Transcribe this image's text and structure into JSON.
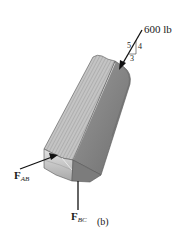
{
  "figure": {
    "caption": "(b)",
    "applied_load": {
      "label": "600 lb",
      "slope_triangle": {
        "hypotenuse": "5",
        "vertical": "4",
        "horizontal": "3"
      }
    },
    "reactions": [
      {
        "id": "FAB",
        "symbol": "F",
        "subscript": "AB",
        "direction": "pushing up-right into end face"
      },
      {
        "id": "FBC",
        "symbol": "F",
        "subscript": "BC",
        "direction": "vertical, below block"
      }
    ],
    "body": {
      "description": "inclined wooden member with grain on top face",
      "top_face_color": "#bdbdbd",
      "side_face_color": "#8a8a8a",
      "end_face_color": "#d6d6d6"
    }
  }
}
